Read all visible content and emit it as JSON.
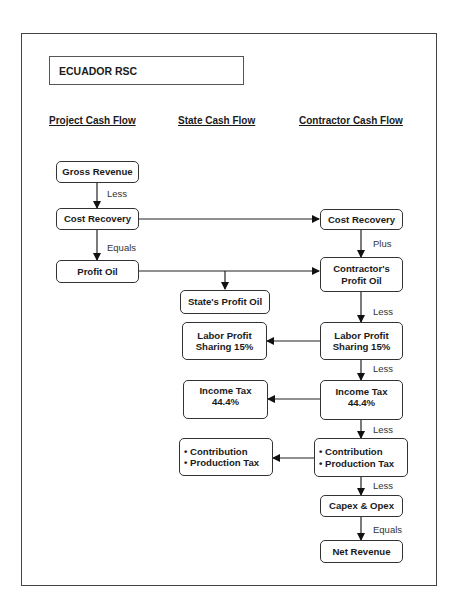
{
  "title": "ECUADOR RSC",
  "columns": {
    "project": "Project Cash Flow",
    "state": "State Cash Flow",
    "contractor": "Contractor Cash Flow"
  },
  "project": {
    "gross_revenue": "Gross Revenue",
    "cost_recovery": "Cost Recovery",
    "profit_oil": "Profit Oil",
    "label_less": "Less",
    "label_equals": "Equals"
  },
  "state": {
    "profit_oil": "State's Profit Oil",
    "labor_1": "Labor Profit",
    "labor_2": "Sharing 15%",
    "income_1": "Income Tax",
    "income_2": "44.4%",
    "contrib_1": "• Contribution",
    "contrib_2": "• Production Tax"
  },
  "contractor": {
    "cost_recovery": "Cost Recovery",
    "profit_oil_1": "Contractor's",
    "profit_oil_2": "Profit Oil",
    "labor_1": "Labor Profit",
    "labor_2": "Sharing 15%",
    "income_1": "Income Tax",
    "income_2": "44.4%",
    "contrib_1": "• Contribution",
    "contrib_2": "• Production Tax",
    "capex_opex": "Capex & Opex",
    "net_revenue": "Net Revenue",
    "label_plus": "Plus",
    "label_less_1": "Less",
    "label_less_2": "Less",
    "label_less_3": "Less",
    "label_less_4": "Less",
    "label_equals": "Equals"
  }
}
